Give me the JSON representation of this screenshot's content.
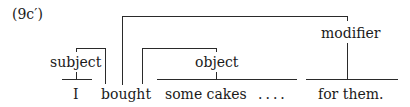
{
  "example_label": "(9c′)",
  "labels": {
    "subject": "subject",
    "object": "object",
    "modifier": "modifier"
  },
  "words": {
    "w1": "I",
    "w2": "bought",
    "w3": "some cakes",
    "ellipsis": "....",
    "w4": "for them."
  }
}
